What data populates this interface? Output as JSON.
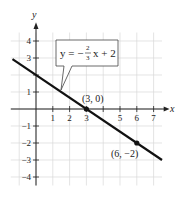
{
  "chart_data": {
    "type": "line",
    "title": "",
    "xlabel": "x",
    "ylabel": "y",
    "xlim": [
      -1.5,
      7.5
    ],
    "ylim": [
      -4.5,
      4.5
    ],
    "grid": true,
    "x_ticks": [
      1,
      2,
      3,
      4,
      5,
      6,
      7
    ],
    "x_tick_labels": [
      "1",
      "2",
      "3",
      "",
      "5",
      "6",
      "7"
    ],
    "y_ticks": [
      -4,
      -3,
      -2,
      -1,
      1,
      2,
      3,
      4
    ],
    "y_tick_labels": [
      "−4",
      "−3",
      "−2",
      "−1",
      "1",
      "",
      "3",
      "4"
    ],
    "series": [
      {
        "name": "y = -2/3 x + 2",
        "slope": -0.6667,
        "intercept": 2,
        "x": [
          -1.4,
          7.5
        ],
        "y": [
          2.93,
          -3.0
        ]
      }
    ],
    "points": [
      {
        "x": 3,
        "y": 0,
        "label": "(3, 0)"
      },
      {
        "x": 6,
        "y": -2,
        "label": "(6, −2)"
      }
    ],
    "annotations": [
      {
        "text": "y = −(2/3)x + 2",
        "type": "callout",
        "points_to": [
          1.5,
          1
        ]
      }
    ]
  },
  "labels": {
    "x_axis": "x",
    "y_axis": "y",
    "equation_prefix": "y = −",
    "equation_num": "2",
    "equation_den": "3",
    "equation_suffix": "x + 2",
    "point_a": "(3, 0)",
    "point_b": "(6, −2)"
  },
  "colors": {
    "line": "#111111",
    "grid": "#d9d9d9",
    "axis": "#222222"
  }
}
